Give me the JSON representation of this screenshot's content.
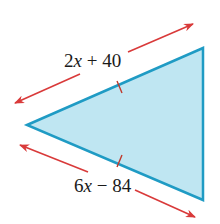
{
  "diagram": {
    "shape": "triangle",
    "fill_color": "#bfe6f2",
    "stroke_color": "#1f9bc4",
    "arrow_color": "#d93a3a",
    "top_side": {
      "coef": "2",
      "var": "x",
      "rest": " + 40"
    },
    "bottom_side": {
      "coef": "6",
      "var": "x",
      "rest": " − 84"
    },
    "congruence_marks": 2
  }
}
